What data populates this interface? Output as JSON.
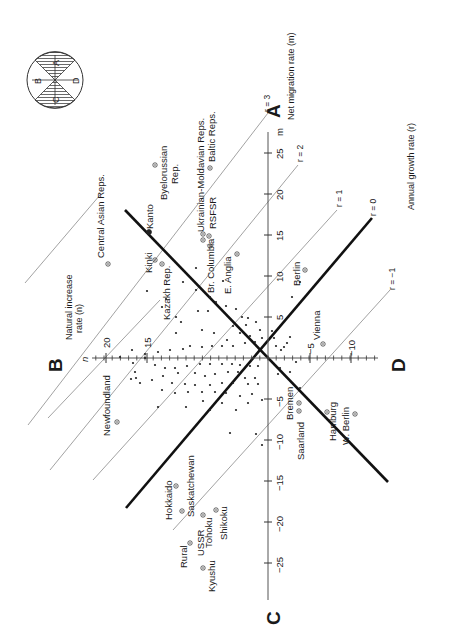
{
  "diagram": {
    "center": {
      "x": 268,
      "y": 358
    },
    "px_per_unit": 8.2,
    "rotation_note": "figure is printed rotated 90 degrees counter-clockwise",
    "quadrant_labels": {
      "A": "A",
      "B": "B",
      "C": "C",
      "D": "D"
    },
    "m_axis": {
      "title": "Net migration rate (m)",
      "symbol": "m",
      "ticks": [
        {
          "value": 5,
          "label": "5"
        },
        {
          "value": 10,
          "label": "10"
        },
        {
          "value": 15,
          "label": "15"
        },
        {
          "value": 20,
          "label": "20"
        },
        {
          "value": 25,
          "label": "25"
        },
        {
          "value": -5,
          "label": "−5"
        },
        {
          "value": -10,
          "label": "−10"
        },
        {
          "value": -15,
          "label": "−15"
        },
        {
          "value": -20,
          "label": "−20"
        },
        {
          "value": -25,
          "label": "−25"
        }
      ]
    },
    "n_axis": {
      "title_line1": "Natural increase",
      "title_line2": "rate (n)",
      "symbol": "n",
      "ticks": [
        {
          "value": 15,
          "label": "15"
        },
        {
          "value": 20,
          "label": "20"
        },
        {
          "value": -5,
          "label": "−5"
        },
        {
          "value": -10,
          "label": "−10"
        }
      ]
    },
    "growth_axis": {
      "title": "Annual growth rate (r)"
    },
    "r_lines": [
      {
        "r": 3,
        "label": "r = 3",
        "thick": false
      },
      {
        "r": 2,
        "label": "r = 2",
        "thick": false
      },
      {
        "r": 1,
        "label": "r = 1",
        "thick": false
      },
      {
        "r": 0,
        "label": "r = 0",
        "thick": true
      },
      {
        "r": -1,
        "label": "r = −1",
        "thick": false
      }
    ],
    "key_circle": {
      "labels": [
        "A",
        "B",
        "C",
        "D"
      ],
      "shaded": [
        "A",
        "C"
      ]
    },
    "named_points": [
      {
        "name": "Byelorussian Rep.",
        "n": -12,
        "m": 22
      },
      {
        "name": "Ukrainian-Moldavian Reps.",
        "n": -3,
        "m": 16
      },
      {
        "name": "Baltic Reps.",
        "n": -9,
        "m": 24
      },
      {
        "name": "RSFSR",
        "n": -2,
        "m": 15
      },
      {
        "name": "Br. Columbia",
        "n": 0,
        "m": 14
      },
      {
        "name": "E. Anglia",
        "n": -1,
        "m": 12
      },
      {
        "name": "Central Asian Reps.",
        "n": 24,
        "m": 15
      },
      {
        "name": "Kanto",
        "n": 8,
        "m": 17
      },
      {
        "name": "Kinki",
        "n": 10,
        "m": 14
      },
      {
        "name": "Kazakh Rep.",
        "n": 8,
        "m": 11
      },
      {
        "name": "Berlin",
        "n": -10,
        "m": 10
      },
      {
        "name": "Vienna",
        "n": -7,
        "m": 3
      },
      {
        "name": "Newfoundland",
        "n": 20,
        "m": -5
      },
      {
        "name": "Bremen",
        "n": -2,
        "m": -7
      },
      {
        "name": "Saarland",
        "n": -1,
        "m": -8
      },
      {
        "name": "Hamburg",
        "n": -5,
        "m": -7
      },
      {
        "name": "W. Berlin",
        "n": -8,
        "m": -10
      },
      {
        "name": "Hokkaido",
        "n": 12,
        "m": -15
      },
      {
        "name": "Saskatchewan",
        "n": 10,
        "m": -16
      },
      {
        "name": "Shikoku",
        "n": 6,
        "m": -19
      },
      {
        "name": "Tohoku",
        "n": 9,
        "m": -19
      },
      {
        "name": "USSR Rural",
        "n": 12,
        "m": -20
      },
      {
        "name": "Kyushu",
        "n": 8,
        "m": -22
      }
    ],
    "named_labels": {
      "byelorussian": "Byelorussian",
      "byelorussian2": "Rep.",
      "ukrainian": "Ukrainian-Moldavian Reps.",
      "baltic": "Baltic Reps.",
      "rsfsr": "RSFSR",
      "brcolumbia": "Br. Columbia",
      "eanglia": "E. Anglia",
      "centralasian": "Central Asian Reps.",
      "kanto": "Kanto",
      "kinki": "Kinki",
      "kazakh": "Kazakh Rep.",
      "berlin": "Berlin",
      "vienna": "Vienna",
      "newfoundland": "Newfoundland",
      "bremen": "Bremen",
      "saarland": "Saarland",
      "hamburg": "Hamburg",
      "wberlin": "W. Berlin",
      "hokkaido": "Hokkaido",
      "saskatchewan": "Saskatchewan",
      "shikoku": "Shikoku",
      "tohoku": "Tohoku",
      "ussr": "USSR",
      "rural": "Rural",
      "kyushu": "Kyushu"
    },
    "scatter_points_px": [
      [
        183,
        282
      ],
      [
        196,
        268
      ],
      [
        223,
        281
      ],
      [
        166,
        299
      ],
      [
        147,
        291
      ],
      [
        162,
        307
      ],
      [
        176,
        317
      ],
      [
        198,
        311
      ],
      [
        208,
        311
      ],
      [
        181,
        322
      ],
      [
        176,
        333
      ],
      [
        202,
        330
      ],
      [
        214,
        333
      ],
      [
        233,
        326
      ],
      [
        246,
        325
      ],
      [
        240,
        333
      ],
      [
        222,
        346
      ],
      [
        233,
        346
      ],
      [
        245,
        343
      ],
      [
        255,
        342
      ],
      [
        250,
        336
      ],
      [
        227,
        340
      ],
      [
        190,
        346
      ],
      [
        202,
        347
      ],
      [
        212,
        346
      ],
      [
        158,
        352
      ],
      [
        170,
        350
      ],
      [
        183,
        349
      ],
      [
        145,
        354
      ],
      [
        132,
        350
      ],
      [
        120,
        357
      ],
      [
        155,
        365
      ],
      [
        165,
        368
      ],
      [
        175,
        368
      ],
      [
        187,
        366
      ],
      [
        200,
        364
      ],
      [
        210,
        364
      ],
      [
        222,
        364
      ],
      [
        232,
        364
      ],
      [
        240,
        365
      ],
      [
        250,
        366
      ],
      [
        258,
        366
      ],
      [
        163,
        376
      ],
      [
        178,
        373
      ],
      [
        195,
        373
      ],
      [
        205,
        376
      ],
      [
        215,
        374
      ],
      [
        228,
        372
      ],
      [
        238,
        372
      ],
      [
        245,
        378
      ],
      [
        255,
        378
      ],
      [
        172,
        383
      ],
      [
        185,
        384
      ],
      [
        195,
        385
      ],
      [
        210,
        385
      ],
      [
        222,
        383
      ],
      [
        233,
        383
      ],
      [
        248,
        384
      ],
      [
        258,
        384
      ],
      [
        175,
        393
      ],
      [
        188,
        392
      ],
      [
        202,
        392
      ],
      [
        215,
        392
      ],
      [
        226,
        393
      ],
      [
        240,
        396
      ],
      [
        252,
        394
      ],
      [
        203,
        401
      ],
      [
        222,
        403
      ],
      [
        248,
        403
      ],
      [
        262,
        400
      ],
      [
        145,
        358
      ],
      [
        133,
        363
      ],
      [
        136,
        378
      ],
      [
        140,
        383
      ],
      [
        135,
        372
      ],
      [
        131,
        379
      ],
      [
        152,
        380
      ],
      [
        162,
        390
      ],
      [
        158,
        407
      ],
      [
        186,
        407
      ],
      [
        210,
        410
      ],
      [
        236,
        410
      ],
      [
        230,
        433
      ],
      [
        256,
        434
      ],
      [
        262,
        445
      ],
      [
        196,
        290
      ],
      [
        210,
        297
      ],
      [
        216,
        302
      ],
      [
        226,
        306
      ],
      [
        236,
        309
      ],
      [
        242,
        317
      ],
      [
        248,
        318
      ],
      [
        256,
        322
      ],
      [
        260,
        330
      ],
      [
        262,
        338
      ],
      [
        272,
        331
      ],
      [
        274,
        338
      ],
      [
        276,
        346
      ],
      [
        281,
        350
      ],
      [
        284,
        347
      ],
      [
        287,
        343
      ],
      [
        290,
        337
      ],
      [
        290,
        372
      ],
      [
        296,
        362
      ],
      [
        280,
        368
      ],
      [
        278,
        374
      ],
      [
        300,
        388
      ],
      [
        292,
        297
      ],
      [
        300,
        282
      ]
    ]
  }
}
